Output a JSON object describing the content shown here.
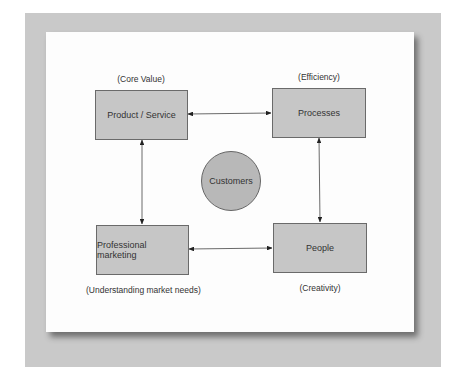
{
  "diagram": {
    "center": {
      "label": "Customers"
    },
    "nodes": [
      {
        "id": "product",
        "label": "Product / Service",
        "caption": "(Core Value)"
      },
      {
        "id": "processes",
        "label": "Processes",
        "caption": "(Efficiency)"
      },
      {
        "id": "marketing",
        "label": "Professional marketing",
        "caption": "(Understanding market needs)"
      },
      {
        "id": "people",
        "label": "People",
        "caption": "(Creativity)"
      }
    ],
    "edges": [
      {
        "from": "product",
        "to": "processes",
        "type": "bidirectional"
      },
      {
        "from": "processes",
        "to": "people",
        "type": "bidirectional"
      },
      {
        "from": "people",
        "to": "marketing",
        "type": "bidirectional"
      },
      {
        "from": "marketing",
        "to": "product",
        "type": "bidirectional"
      }
    ],
    "colors": {
      "box_fill": "#c6c6c6",
      "circle_fill": "#b8b8b8",
      "frame": "#c9c9c9",
      "card": "#fdfdfd"
    }
  }
}
